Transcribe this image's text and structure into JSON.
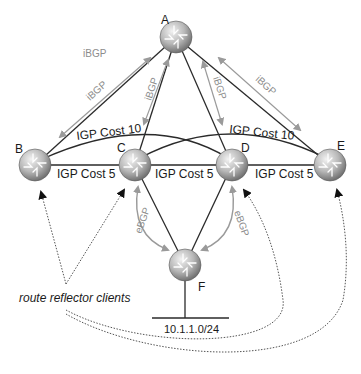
{
  "diagram": {
    "colors": {
      "link": "#2a2a2a",
      "bgp_arrow": "#9a9a9a",
      "bgp_text": "#8c8c8c",
      "dotted": "#555555",
      "router_light": "#e6e6e6",
      "router_dark": "#7a7a7a"
    },
    "routers": [
      {
        "id": "A",
        "label": "A",
        "x": 176,
        "y": 37
      },
      {
        "id": "B",
        "label": "B",
        "x": 35,
        "y": 165
      },
      {
        "id": "C",
        "label": "C",
        "x": 135,
        "y": 165
      },
      {
        "id": "D",
        "label": "D",
        "x": 232,
        "y": 165
      },
      {
        "id": "E",
        "label": "E",
        "x": 330,
        "y": 165
      },
      {
        "id": "F",
        "label": "F",
        "x": 185,
        "y": 265
      }
    ],
    "igp_links": [
      {
        "from": "B",
        "to": "C",
        "label": "IGP Cost 5"
      },
      {
        "from": "C",
        "to": "D",
        "label": "IGP Cost 5"
      },
      {
        "from": "D",
        "to": "E",
        "label": "IGP Cost 5"
      },
      {
        "from": "B",
        "to": "D",
        "label": "IGP Cost 10"
      },
      {
        "from": "C",
        "to": "E",
        "label": "IGP Cost 10"
      }
    ],
    "ibgp_sessions": [
      {
        "from": "A",
        "to": "B",
        "label": "iBGP"
      },
      {
        "from": "A",
        "to": "C",
        "label": "iBGP"
      },
      {
        "from": "A",
        "to": "D",
        "label": "iBGP"
      },
      {
        "from": "A",
        "to": "E",
        "label": "iBGP"
      }
    ],
    "ibgp_title": "iBGP",
    "ebgp_sessions": [
      {
        "from": "C",
        "to": "F",
        "label": "eBGP"
      },
      {
        "from": "D",
        "to": "F",
        "label": "eBGP"
      }
    ],
    "network": {
      "label": "10.1.1.0/24"
    },
    "annotation": {
      "label": "route reflector clients",
      "targets": [
        "B",
        "C",
        "D",
        "E"
      ]
    }
  }
}
